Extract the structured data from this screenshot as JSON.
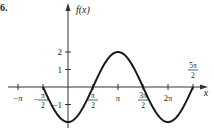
{
  "problem_number": "6.",
  "chart_data": {
    "type": "line",
    "title": "",
    "function": "f(x) = -2cos(x)",
    "xlabel": "x",
    "ylabel": "f(x)",
    "x_ticks": [
      {
        "value": -3.14159,
        "label": "-π"
      },
      {
        "value": -1.5708,
        "label": "-π/2",
        "num": "π",
        "neg": true
      },
      {
        "value": 1.5708,
        "label": "π/2",
        "num": "π"
      },
      {
        "value": 3.14159,
        "label": "π"
      },
      {
        "value": 4.71239,
        "label": "3π/2",
        "num": "3π"
      },
      {
        "value": 6.28319,
        "label": "2π"
      },
      {
        "value": 7.85398,
        "label": "5π/2",
        "num": "5π"
      }
    ],
    "y_ticks": [
      {
        "value": 2,
        "label": "2"
      },
      {
        "value": 1,
        "label": "1"
      },
      {
        "value": -1,
        "label": "-1"
      }
    ],
    "domain": [
      -1.5708,
      7.85398
    ],
    "x": [
      -1.5708,
      0,
      1.5708,
      3.14159,
      4.71239,
      6.28319,
      7.85398
    ],
    "values": [
      0,
      -2,
      0,
      2,
      0,
      -2,
      0
    ],
    "ylim": [
      -2,
      2
    ],
    "grid": false,
    "colors": {
      "curve": "#1a1a1a",
      "axis": "#333333"
    }
  }
}
